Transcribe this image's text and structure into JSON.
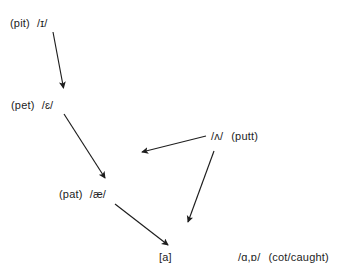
{
  "diagram": {
    "background_color": "#ffffff",
    "text_color": "#1d1d1d",
    "arrow_color": "#1d1d1d",
    "nodes": [
      {
        "id": "pit",
        "word": "(pit)",
        "phone": "/ɪ/"
      },
      {
        "id": "pet",
        "word": "(pet)",
        "phone": "/ɛ/"
      },
      {
        "id": "pat",
        "word": "(pat)",
        "phone": "/æ/"
      },
      {
        "id": "a",
        "phone": "[a]"
      },
      {
        "id": "putt",
        "phone": "/ʌ/",
        "word": "(putt)"
      },
      {
        "id": "cot",
        "phone": "/ɑ,ɒ/",
        "word": "(cot/caught)"
      }
    ],
    "arrows": [
      {
        "id": "pit-to-pet",
        "from": "pit",
        "to": "pet"
      },
      {
        "id": "pet-to-pat",
        "from": "pet",
        "to": "pat"
      },
      {
        "id": "putt-to-pat",
        "from": "putt",
        "to": "pat"
      },
      {
        "id": "putt-to-a",
        "from": "putt",
        "to": "a"
      },
      {
        "id": "pat-to-a",
        "from": "pat",
        "to": "a"
      }
    ]
  }
}
